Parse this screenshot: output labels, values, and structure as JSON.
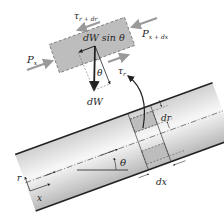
{
  "diagram": {
    "element_labels": {
      "shear_top": "τ",
      "shear_top_sub": "r + dr",
      "shear_bottom": "τ",
      "shear_bottom_sub": "r",
      "pressure_left": "P",
      "pressure_left_sub": "x",
      "pressure_right": "P",
      "pressure_right_sub": "x + dx",
      "weight_component": "dW sin θ",
      "weight": "dW",
      "angle_element": "θ"
    },
    "pipe_labels": {
      "angle": "θ",
      "radial_thickness": "dr",
      "axial_length": "dx",
      "axis_r": "r",
      "axis_x": "x"
    },
    "colors": {
      "element_fill": "#bdbdbd",
      "pipe_fill_light": "#f4f4f4",
      "pipe_fill_dark": "#c8c8c8",
      "arrow_gray": "#9a9a9a",
      "line_dark": "#222222"
    }
  }
}
